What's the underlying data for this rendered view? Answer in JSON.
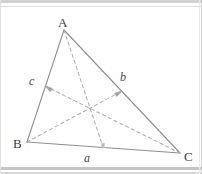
{
  "figure": {
    "background_color": "#ffffff",
    "stroke_color": "#8c8c8c",
    "dash_color": "#a8a8a8",
    "label_color": "#3c3c3c"
  },
  "vertices": {
    "A": {
      "label": "A",
      "x": 64,
      "y": 30
    },
    "B": {
      "label": "B",
      "x": 27,
      "y": 142
    },
    "C": {
      "label": "C",
      "x": 180,
      "y": 153
    }
  },
  "sides": {
    "a": {
      "label": "a",
      "between": "B-C"
    },
    "b": {
      "label": "b",
      "between": "A-C"
    },
    "c": {
      "label": "c",
      "between": "A-B"
    }
  },
  "midpoints": {
    "mid_BC": {
      "x": 103,
      "y": 147
    },
    "mid_AC": {
      "x": 122,
      "y": 91
    },
    "mid_AB": {
      "x": 45,
      "y": 86
    }
  },
  "centroid": {
    "x": 90,
    "y": 108
  },
  "medians": [
    {
      "name": "median-from-A",
      "from": "A",
      "to": "mid_BC",
      "arrow": false
    },
    {
      "name": "median-from-B",
      "from": "B",
      "to": "mid_AC",
      "arrow": true
    },
    {
      "name": "median-from-C",
      "from": "C",
      "to": "mid_AB",
      "arrow": true
    }
  ]
}
